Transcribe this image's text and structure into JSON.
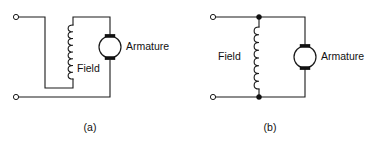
{
  "figure": {
    "background_color": "#ffffff",
    "line_color": "#1a1a1a",
    "width": 373,
    "height": 151
  },
  "diagrams": [
    {
      "id": "circuit-a",
      "caption": "(a)",
      "caption_x": 90,
      "caption_y": 128,
      "connection_type": "series",
      "field": {
        "label": "Field",
        "label_x": 77,
        "label_y": 69,
        "coil_turns": 8,
        "orientation": "vertical"
      },
      "armature": {
        "label": "Armature",
        "label_x": 126,
        "label_y": 47,
        "center_x": 110,
        "center_y": 47,
        "radius": 11
      },
      "terminals": [
        {
          "name": "terminal-top",
          "x": 16,
          "y": 17
        },
        {
          "name": "terminal-bottom",
          "x": 16,
          "y": 97
        }
      ]
    },
    {
      "id": "circuit-b",
      "caption": "(b)",
      "caption_x": 270,
      "caption_y": 128,
      "connection_type": "shunt",
      "field": {
        "label": "Field",
        "label_x": 218,
        "label_y": 57,
        "coil_turns": 8,
        "orientation": "vertical"
      },
      "armature": {
        "label": "Armature",
        "label_x": 322,
        "label_y": 57,
        "center_x": 305,
        "center_y": 57,
        "radius": 11
      },
      "terminals": [
        {
          "name": "terminal-top",
          "x": 213,
          "y": 17
        },
        {
          "name": "terminal-bottom",
          "x": 213,
          "y": 97
        }
      ],
      "junctions": [
        {
          "name": "junction-top",
          "x": 259,
          "y": 17
        },
        {
          "name": "junction-bottom",
          "x": 259,
          "y": 97
        }
      ]
    }
  ]
}
